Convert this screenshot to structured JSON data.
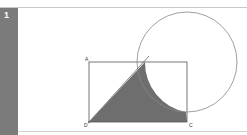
{
  "question": {
    "number": "1"
  },
  "figure": {
    "labels": {
      "A": "A",
      "B": "",
      "C": "C",
      "D": "D"
    },
    "colors": {
      "stroke": "#555555",
      "shade": "#6e6e6e",
      "circle": "#888888"
    }
  }
}
